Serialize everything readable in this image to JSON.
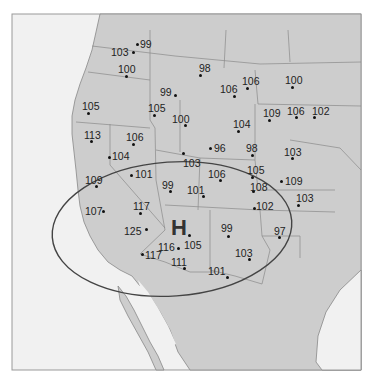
{
  "map": {
    "title": "",
    "high_pressure_label": "H",
    "colors": {
      "ocean": "#f3f3f3",
      "land": "#cfcfcf",
      "border": "#888888",
      "ellipse": "#444444",
      "text": "#222222"
    },
    "stations": [
      {
        "value": "99",
        "dot": [
          137,
          44
        ],
        "label": [
          140,
          39
        ]
      },
      {
        "value": "98",
        "dot": [
          200,
          75
        ],
        "label": [
          199,
          63
        ]
      },
      {
        "value": "103",
        "dot": [
          133,
          52
        ],
        "label": [
          111,
          47
        ]
      },
      {
        "value": "100",
        "dot": [
          126,
          76
        ],
        "label": [
          118,
          64
        ]
      },
      {
        "value": "99",
        "dot": [
          175,
          95
        ],
        "label": [
          160,
          87
        ]
      },
      {
        "value": "106",
        "dot": [
          234,
          96
        ],
        "label": [
          220,
          84
        ]
      },
      {
        "value": "106",
        "dot": [
          247,
          88
        ],
        "label": [
          242,
          76
        ]
      },
      {
        "value": "100",
        "dot": [
          292,
          87
        ],
        "label": [
          285,
          75
        ]
      },
      {
        "value": "105",
        "dot": [
          88,
          113
        ],
        "label": [
          82,
          101
        ]
      },
      {
        "value": "105",
        "dot": [
          154,
          115
        ],
        "label": [
          148,
          103
        ]
      },
      {
        "value": "100",
        "dot": [
          185,
          125
        ],
        "label": [
          172,
          114
        ]
      },
      {
        "value": "109",
        "dot": [
          269,
          120
        ],
        "label": [
          263,
          108
        ]
      },
      {
        "value": "106",
        "dot": [
          296,
          117
        ],
        "label": [
          287,
          106
        ]
      },
      {
        "value": "102",
        "dot": [
          314,
          117
        ],
        "label": [
          312,
          106
        ]
      },
      {
        "value": "104",
        "dot": [
          238,
          131
        ],
        "label": [
          233,
          119
        ]
      },
      {
        "value": "113",
        "dot": [
          91,
          141
        ],
        "label": [
          84,
          130
        ]
      },
      {
        "value": "106",
        "dot": [
          133,
          144
        ],
        "label": [
          126,
          132
        ]
      },
      {
        "value": "104",
        "dot": [
          109,
          157
        ],
        "label": [
          112,
          151
        ]
      },
      {
        "value": "96",
        "dot": [
          210,
          148
        ],
        "label": [
          214,
          143
        ]
      },
      {
        "value": "98",
        "dot": [
          252,
          155
        ],
        "label": [
          246,
          143
        ]
      },
      {
        "value": "103",
        "dot": [
          292,
          158
        ],
        "label": [
          284,
          147
        ]
      },
      {
        "value": "103",
        "dot": [
          183,
          153
        ],
        "label": [
          183,
          158
        ]
      },
      {
        "value": "101",
        "dot": [
          131,
          175
        ],
        "label": [
          135,
          169
        ]
      },
      {
        "value": "106",
        "dot": [
          220,
          180
        ],
        "label": [
          208,
          169
        ]
      },
      {
        "value": "105",
        "dot": [
          252,
          177
        ],
        "label": [
          247,
          165
        ]
      },
      {
        "value": "99",
        "dot": [
          170,
          191
        ],
        "label": [
          162,
          180
        ]
      },
      {
        "value": "101",
        "dot": [
          203,
          196
        ],
        "label": [
          187,
          185
        ]
      },
      {
        "value": "108",
        "dot": [
          253,
          191
        ],
        "label": [
          250,
          182
        ]
      },
      {
        "value": "109",
        "dot": [
          281,
          181
        ],
        "label": [
          285,
          176
        ]
      },
      {
        "value": "109",
        "dot": [
          96,
          186
        ],
        "label": [
          85,
          175
        ]
      },
      {
        "value": "102",
        "dot": [
          254,
          208
        ],
        "label": [
          256,
          201
        ]
      },
      {
        "value": "103",
        "dot": [
          298,
          205
        ],
        "label": [
          296,
          193
        ]
      },
      {
        "value": "117",
        "dot": [
          140,
          213
        ],
        "label": [
          133,
          201
        ]
      },
      {
        "value": "107",
        "dot": [
          103,
          211
        ],
        "label": [
          85,
          206
        ]
      },
      {
        "value": "97",
        "dot": [
          279,
          237
        ],
        "label": [
          274,
          226
        ]
      },
      {
        "value": "125",
        "dot": [
          146,
          229
        ],
        "label": [
          124,
          226
        ]
      },
      {
        "value": "99",
        "dot": [
          228,
          236
        ],
        "label": [
          221,
          223
        ]
      },
      {
        "value": "116",
        "dot": [
          178,
          248
        ],
        "label": [
          158,
          242
        ]
      },
      {
        "value": "105",
        "dot": [
          189,
          235
        ],
        "label": [
          184,
          240
        ]
      },
      {
        "value": "103",
        "dot": [
          249,
          259
        ],
        "label": [
          235,
          248
        ]
      },
      {
        "value": "117",
        "dot": [
          142,
          254
        ],
        "label": [
          145,
          250
        ]
      },
      {
        "value": "111",
        "dot": [
          184,
          268
        ],
        "label": [
          171,
          257
        ]
      },
      {
        "value": "101",
        "dot": [
          227,
          277
        ],
        "label": [
          208,
          266
        ]
      }
    ]
  }
}
